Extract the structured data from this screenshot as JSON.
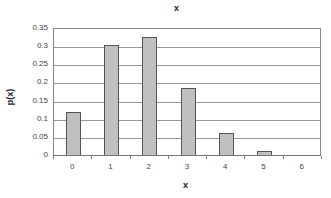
{
  "chart_data": {
    "type": "bar",
    "title": "x",
    "xlabel": "x",
    "ylabel": "p(x)",
    "categories": [
      "0",
      "1",
      "2",
      "3",
      "4",
      "5",
      "6"
    ],
    "values": [
      0.118,
      0.303,
      0.324,
      0.185,
      0.06,
      0.01,
      0.001
    ],
    "ylim": [
      0,
      0.35
    ],
    "yticks": [
      "0.35",
      "0.3",
      "0.25",
      "0.2",
      "0.15",
      "0.1",
      "0.05",
      "0"
    ],
    "grid": true,
    "legend": "none",
    "bar_color": "#c0c0c0",
    "bar_edge_color": "#555555"
  }
}
